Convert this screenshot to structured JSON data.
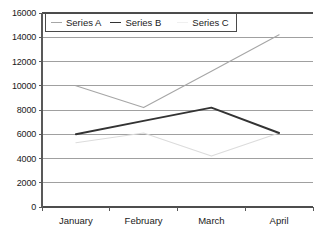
{
  "chart_data": {
    "type": "line",
    "title": "",
    "xlabel": "",
    "ylabel": "",
    "categories": [
      "January",
      "February",
      "March",
      "April"
    ],
    "series": [
      {
        "name": "Series A",
        "color": "#a6a6a6",
        "values": [
          10000,
          8200,
          11200,
          14200
        ]
      },
      {
        "name": "Series B",
        "color": "#333333",
        "values": [
          6000,
          7100,
          8200,
          6100
        ]
      },
      {
        "name": "Series C",
        "color": "#dcdcdc",
        "values": [
          5300,
          6100,
          4200,
          6100
        ]
      }
    ],
    "ylim": [
      0,
      16000
    ],
    "ytick_step": 2000,
    "yticks": [
      0,
      2000,
      4000,
      6000,
      8000,
      10000,
      12000,
      14000,
      16000
    ],
    "ytick_labels": [
      "0",
      "2000",
      "4000",
      "6000",
      "8000",
      "10000",
      "12000",
      "14000",
      "16000"
    ],
    "grid": true,
    "grid_axis": "y",
    "grid_color": "#808080",
    "axis_color": "#595959",
    "legend_position": "top-left-inside",
    "legend_border_color": "#4a4a4a",
    "plot_background": "#ffffff"
  },
  "legend": {
    "items": [
      {
        "label": "Series A",
        "swatch": "line-marker-series-a"
      },
      {
        "label": "Series B",
        "swatch": "line-marker-series-b"
      },
      {
        "label": "Series C",
        "swatch": "line-marker-series-c"
      }
    ]
  }
}
